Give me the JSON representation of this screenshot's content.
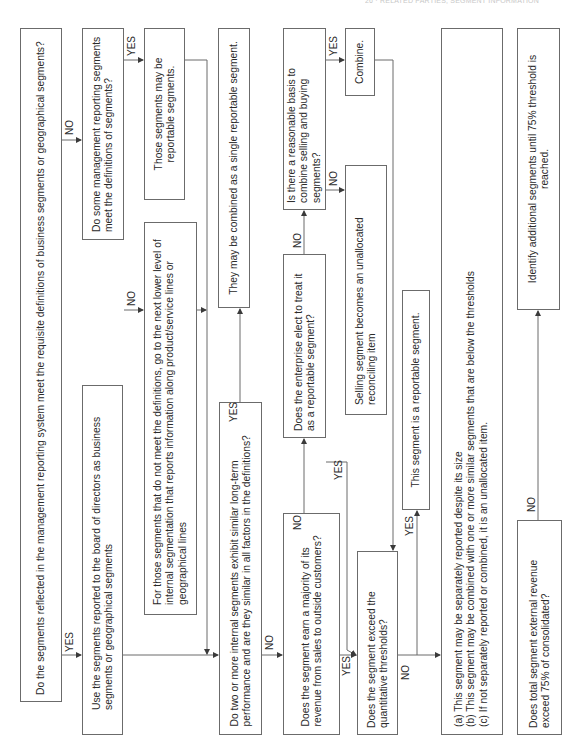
{
  "header": {
    "text": "26 · RELATED PARTIES, SEGMENT INFORMATION"
  },
  "nodes": {
    "q_mgmt_system": "Do the segments reflected in the management reporting system meet the requisite definitions of business segments or geographical segments?",
    "use_board_segments": "Use the segments reported to the board of directors as business segments or geographical segments",
    "q_some_mgmt": "Do some management reporting segments meet the definitions of segments?",
    "those_reportable": "Those segments may be reportable segments.",
    "next_lower_level": "For those segments that do not meet the definitions, go to the next lower level of internal segmentation that reports information along product/service lines or geographical lines",
    "combined_single": "They may be combined as a single reportable segment.",
    "q_two_or_more": "Do two or more internal segments exhibit similar long-term performance and are they similar in all factors in the definitions?",
    "q_majority_revenue": "Does the segment earn a majority of its revenue from sales to outside customers?",
    "q_reasonable_basis": "Is there a reasonable basis to combine selling and buying segments?",
    "combine": "Combine.",
    "selling_unallocated": "Selling segment becomes an unallocated reconciling item",
    "q_enterprise_elect": "Does the enterprise elect to treat it as a reportable segment?",
    "is_reportable": "This segment is a reportable segment.",
    "q_exceed_thresholds": "Does the segment exceed the quantitative thresholds?",
    "options_a": "(a) This segment may be separately reported despite its size",
    "options_b": "(b) This segment may be combined with one or more similar segments that are below the thresholds",
    "options_c": "(c) If not separately reported or combined, it is an unallocated item.",
    "q_total_75": "Does total segment external revenue exceed 75% of consolidated?",
    "identify_additional": "Identify additional segments until 75% threshold is reached."
  },
  "edge_labels": {
    "yes": "YES",
    "no": "NO"
  },
  "colors": {
    "line": "#6b6b6b",
    "text": "#2a2a2a",
    "background": "#ffffff"
  }
}
